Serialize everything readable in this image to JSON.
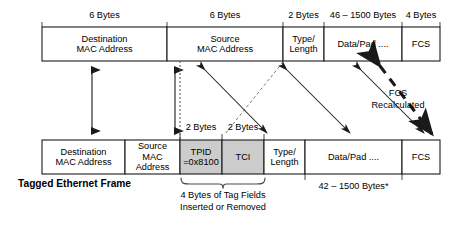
{
  "diagram": {
    "colors": {
      "stroke": "#1a1a1a",
      "shaded_fill": "#cccccc",
      "plain_fill": "#ffffff",
      "text": "#000000"
    }
  },
  "untagged_frame": {
    "size_labels": [
      {
        "text": "6 Bytes"
      },
      {
        "text": "6 Bytes"
      },
      {
        "text": "2 Bytes"
      },
      {
        "text": "46 – 1500 Bytes"
      },
      {
        "text": "4 Bytes"
      }
    ],
    "fields": [
      {
        "line1": "Destination",
        "line2": "MAC Address"
      },
      {
        "line1": "Source",
        "line2": "MAC Address"
      },
      {
        "line1": "Type/",
        "line2": "Length"
      },
      {
        "line1": "Data/Pad ....",
        "line2": ""
      },
      {
        "line1": "FCS",
        "line2": ""
      }
    ]
  },
  "tagged_frame": {
    "title": "Tagged Ethernet Frame",
    "size_labels": [
      {
        "text": "2 Bytes"
      },
      {
        "text": "2 Bytes"
      }
    ],
    "payload_size_label": "42 – 1500 Bytes*",
    "fields": [
      {
        "line1": "Destination",
        "line2": "MAC Address"
      },
      {
        "line1": "Source",
        "line2": "MAC Address"
      },
      {
        "line1": "TPID",
        "line2": "=0x8100"
      },
      {
        "line1": "TCI",
        "line2": ""
      },
      {
        "line1": "Type/",
        "line2": "Length"
      },
      {
        "line1": "Data/Pad ....",
        "line2": ""
      },
      {
        "line1": "FCS",
        "line2": ""
      }
    ]
  },
  "annotations": {
    "fcs_recalculated": {
      "line1": "FCS",
      "line2": "Recalculated"
    },
    "tag_fields": {
      "line1": "4 Bytes of Tag Fields",
      "line2": "Inserted or Removed"
    }
  }
}
